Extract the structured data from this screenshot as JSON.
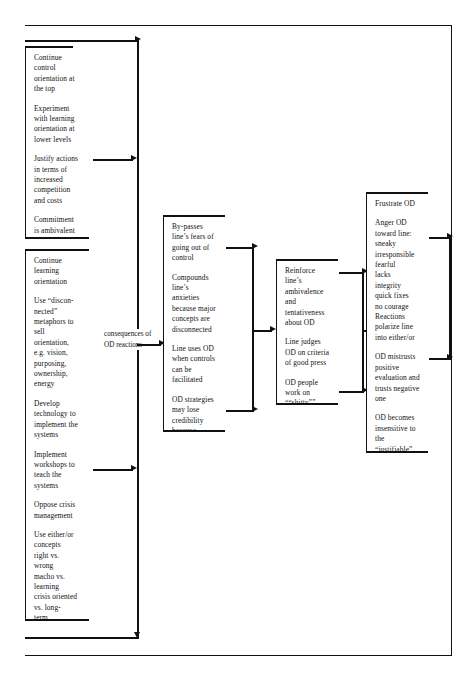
{
  "diagram": {
    "line_color": "#111111",
    "background": "#ffffff",
    "connector_label": "consequences of\nOD reactions",
    "columns": [
      {
        "id": "col1",
        "boxes": [
          {
            "id": "box-control-orientation",
            "paragraphs": [
              "Continue\ncontrol\norientation at\nthe top",
              "Experiment\nwith learning\norientation at\nlower levels",
              "Justify actions\nin terms of\nincreased\ncompetition\nand costs",
              "Commitment\nis ambivalent\nand\nambivalence\nis covert"
            ]
          },
          {
            "id": "box-learning-orientation",
            "paragraphs": [
              "Continue\nlearning\norientation",
              "Use “discon-\nnected”\nmetaphors to\nsell\norientation,\ne.g. vision,\npurposing,\nownership,\nenergy",
              "Develop\ntechnology to\nimplement the\nsystems",
              "Implement\nworkshops to\nteach the\nsystems",
              "Oppose crisis\nmanagement",
              "Use either/or\n   concepts\nright vs.\n   wrong\nmacho vs.\n   learning\ncrisis oriented\n   vs. long-\n   term\nrevenue\n   generating vs.\n   systems\n   building"
            ]
          }
        ]
      },
      {
        "id": "col2",
        "boxes": [
          {
            "id": "box-bypasses",
            "paragraphs": [
              "By-passes\nline’s fears of\ngoing out of\ncontrol",
              "Compounds\nline’s\nanxieties\nbecause major\nconcepts are\ndisconnected",
              "Line uses OD\nwhen controls\ncan be\nfacilitated",
              "OD strategies\nmay lose\ncredibility\nbecause\nefforts are\ninfected by\ncrises, short-\nterm rewards"
            ]
          }
        ]
      },
      {
        "id": "col3",
        "boxes": [
          {
            "id": "box-reinforce",
            "paragraphs": [
              "Reinforce\nline’s\nambivalence\nand\ntentativeness\nabout OD",
              "Line judges\nOD on criteria\nof good press",
              "OD people\nwork on\n““shitty””\nissues"
            ]
          }
        ]
      },
      {
        "id": "col4",
        "boxes": [
          {
            "id": "box-frustrate",
            "paragraphs": [
              "Frustrate OD",
              "Anger OD\ntoward line:\n   sneaky\n   irresponsible\n   fearful\n   lacks\n   integrity\n   quick fixes\n   no courage\nReactions\npolarize line\ninto either/or",
              "OD mistrusts\npositive\nevaluation and\ntrusts negative\none",
              "OD becomes\ninsensitive to\nthe\n“justifiable”\ndefensive\nroutines of\nmanagement’s\nlack of\nempathy"
            ]
          }
        ]
      }
    ]
  }
}
